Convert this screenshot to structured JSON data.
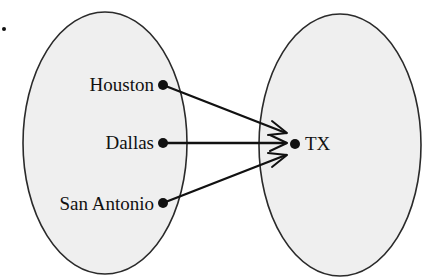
{
  "figure": {
    "label_mark": "."
  },
  "domain_set": {
    "elements": [
      {
        "label": "Houston",
        "x": 163,
        "y": 85
      },
      {
        "label": "Dallas",
        "x": 163,
        "y": 143
      },
      {
        "label": "San Antonio",
        "x": 163,
        "y": 203
      }
    ]
  },
  "range_set": {
    "elements": [
      {
        "label": "TX",
        "x": 295,
        "y": 144
      }
    ]
  },
  "mappings": [
    {
      "from": "Houston",
      "to": "TX"
    },
    {
      "from": "Dallas",
      "to": "TX"
    },
    {
      "from": "San Antonio",
      "to": "TX"
    }
  ],
  "colors": {
    "set_fill": "#efefef",
    "stroke": "#2a2a2a",
    "ink": "#111111"
  }
}
